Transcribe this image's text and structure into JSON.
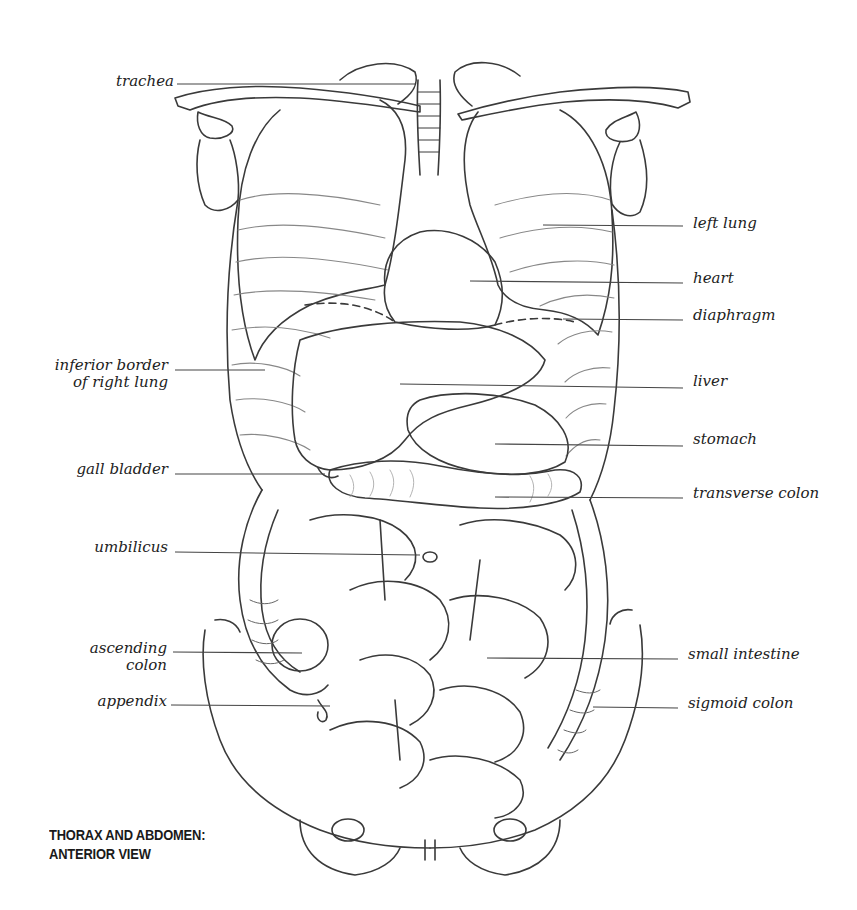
{
  "figure": {
    "caption_line1": "THORAX AND ABDOMEN:",
    "caption_line2": "ANTERIOR VIEW",
    "stroke_color": "#333333",
    "leader_color": "#444444"
  },
  "labels_left": [
    {
      "id": "trachea",
      "text": "trachea",
      "x": 114,
      "y": 73,
      "w": 60,
      "line": [
        177,
        84,
        415,
        84
      ]
    },
    {
      "id": "inferior-border-of-right-lung",
      "text": "inferior border\nof right lung",
      "x": 30,
      "y": 357,
      "w": 138,
      "line": [
        175,
        370,
        265,
        370
      ]
    },
    {
      "id": "gall-bladder",
      "text": "gall bladder",
      "x": 60,
      "y": 461,
      "w": 108,
      "line": [
        175,
        474,
        325,
        474
      ]
    },
    {
      "id": "umbilicus",
      "text": "umbilicus",
      "x": 75,
      "y": 539,
      "w": 93,
      "line": [
        175,
        552,
        420,
        555
      ]
    },
    {
      "id": "ascending-colon",
      "text": "ascending\ncolon",
      "x": 70,
      "y": 640,
      "w": 97,
      "line": [
        173,
        652,
        302,
        653
      ]
    },
    {
      "id": "appendix",
      "text": "appendix",
      "x": 80,
      "y": 693,
      "w": 87,
      "line": [
        171,
        705,
        330,
        706
      ]
    }
  ],
  "labels_right": [
    {
      "id": "left-lung",
      "text": "left lung",
      "x": 693,
      "y": 215,
      "line": [
        543,
        225,
        683,
        226
      ]
    },
    {
      "id": "heart",
      "text": "heart",
      "x": 693,
      "y": 270,
      "line": [
        470,
        281,
        683,
        283
      ]
    },
    {
      "id": "diaphragm",
      "text": "diaphragm",
      "x": 693,
      "y": 307,
      "line": [
        563,
        319,
        683,
        320
      ]
    },
    {
      "id": "liver",
      "text": "liver",
      "x": 693,
      "y": 373,
      "line": [
        400,
        384,
        683,
        388
      ]
    },
    {
      "id": "stomach",
      "text": "stomach",
      "x": 693,
      "y": 431,
      "line": [
        495,
        444,
        683,
        446
      ]
    },
    {
      "id": "transverse-colon",
      "text": "transverse colon",
      "x": 693,
      "y": 485,
      "line": [
        495,
        497,
        683,
        498
      ]
    },
    {
      "id": "small-intestine",
      "text": "small intestine",
      "x": 688,
      "y": 646,
      "line": [
        487,
        658,
        678,
        659
      ]
    },
    {
      "id": "sigmoid-colon",
      "text": "sigmoid colon",
      "x": 688,
      "y": 695,
      "line": [
        593,
        707,
        678,
        708
      ]
    }
  ]
}
